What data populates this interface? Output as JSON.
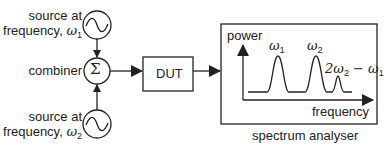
{
  "source1": {
    "line1": "source at",
    "line2": "frequency, ",
    "symbol": "ω",
    "sub": "1"
  },
  "combiner": {
    "label": "combiner",
    "symbol": "Σ"
  },
  "source2": {
    "line1": "source at",
    "line2": "frequency, ",
    "symbol": "ω",
    "sub": "2"
  },
  "dut": {
    "label": "DUT"
  },
  "analyser": {
    "caption": "spectrum analyser",
    "y_axis": "power",
    "x_axis": "frequency",
    "peaks": [
      {
        "symbol": "ω",
        "sub": "1"
      },
      {
        "symbol": "ω",
        "sub": "2"
      },
      {
        "prefix": "2ω",
        "sub": "2",
        "suffix": " − ω",
        "sub2": "1"
      }
    ]
  },
  "colors": {
    "line": "#222222",
    "background": "#ffffff"
  }
}
